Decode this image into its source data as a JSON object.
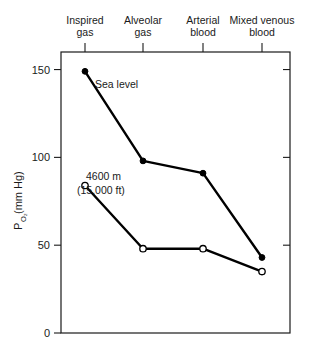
{
  "chart_data": {
    "type": "line",
    "title": "",
    "xlabel": "",
    "ylabel": "PO2 (mm Hg)",
    "ylabel_main": "P",
    "ylabel_sub": "O₂",
    "ylabel_unit": " (mm Hg)",
    "categories": [
      "Inspired gas",
      "Alveolar gas",
      "Arterial blood",
      "Mixed venous blood"
    ],
    "category_lines": [
      [
        "Inspired",
        "gas"
      ],
      [
        "Alveolar",
        "gas"
      ],
      [
        "Arterial",
        "blood"
      ],
      [
        "Mixed venous",
        "blood"
      ]
    ],
    "ylim": [
      0,
      160
    ],
    "yticks": [
      0,
      50,
      100,
      150
    ],
    "ytick_labels": [
      "0",
      "50",
      "100",
      "150"
    ],
    "grid": false,
    "legend_position": "inline-annotation",
    "series": [
      {
        "name": "Sea level",
        "marker": "filled-circle",
        "color": "#000000",
        "values": [
          149,
          98,
          91,
          43
        ]
      },
      {
        "name": "4600 m (15,000 ft)",
        "marker": "open-circle",
        "color": "#000000",
        "values": [
          84,
          48,
          48,
          35
        ]
      }
    ],
    "annotations": [
      {
        "text": "Sea level",
        "series": "Sea level",
        "at_category": "Inspired gas"
      },
      {
        "text_line1": "4600 m",
        "text_line2": "(15,000 ft)",
        "series": "4600 m (15,000 ft)",
        "at_category": "Inspired gas"
      }
    ]
  },
  "colors": {
    "axis": "#1a1a1a",
    "line": "#000000",
    "background": "#ffffff",
    "marker_fill_open": "#ffffff"
  }
}
